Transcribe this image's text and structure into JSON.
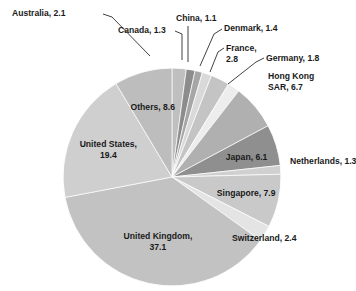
{
  "chart_data": {
    "type": "pie",
    "title": "",
    "subtitle": "",
    "xlabel": "",
    "ylabel": "",
    "legend_position": "none",
    "grid": false,
    "units": "percent",
    "total": 100.0,
    "start_angle_deg": 0,
    "direction": "clockwise",
    "categories": [
      "Australia",
      "Canada",
      "China",
      "Denmark",
      "France",
      "Germany",
      "Hong Kong SAR",
      "Japan",
      "Netherlands",
      "Singapore",
      "Switzerland",
      "United Kingdom",
      "United States",
      "Others"
    ],
    "values": [
      2.1,
      1.3,
      1.1,
      1.4,
      2.8,
      1.8,
      6.7,
      6.1,
      1.3,
      7.9,
      2.4,
      37.1,
      19.4,
      8.6
    ],
    "slices": [
      {
        "name": "Australia",
        "value": 2.1,
        "label": "Australia, 2.1",
        "color": "#bfbfbf",
        "label_style": "callout"
      },
      {
        "name": "Canada",
        "value": 1.3,
        "label": "Canada, 1.3",
        "color": "#8c8c8c",
        "label_style": "callout"
      },
      {
        "name": "China",
        "value": 1.1,
        "label": "China, 1.1",
        "color": "#a6a6a6",
        "label_style": "callout"
      },
      {
        "name": "Denmark",
        "value": 1.4,
        "label": "Denmark, 1.4",
        "color": "#d9d9d9",
        "label_style": "callout"
      },
      {
        "name": "France",
        "value": 2.8,
        "label": "France,\n2.8",
        "color": "#c4c4c4",
        "label_style": "callout"
      },
      {
        "name": "Germany",
        "value": 1.8,
        "label": "Germany, 1.8",
        "color": "#ededed",
        "label_style": "callout"
      },
      {
        "name": "Hong Kong SAR",
        "value": 6.7,
        "label": "Hong Kong\nSAR, 6.7",
        "color": "#b0b0b0",
        "label_style": "callout"
      },
      {
        "name": "Japan",
        "value": 6.1,
        "label": "Japan, 6.1",
        "color": "#8f8f8f",
        "label_style": "inside"
      },
      {
        "name": "Netherlands",
        "value": 1.3,
        "label": "Netherlands, 1.3",
        "color": "#d0d0d0",
        "label_style": "callout"
      },
      {
        "name": "Singapore",
        "value": 7.9,
        "label": "Singapore, 7.9",
        "color": "#c9c9c9",
        "label_style": "inside"
      },
      {
        "name": "Switzerland",
        "value": 2.4,
        "label": "Switzerland, 2.4",
        "color": "#e4e4e4",
        "label_style": "callout"
      },
      {
        "name": "United Kingdom",
        "value": 37.1,
        "label": "United Kingdom,\n37.1",
        "color": "#c2c2c2",
        "label_style": "inside"
      },
      {
        "name": "United States",
        "value": 19.4,
        "label": "United States,\n19.4",
        "color": "#cfcfcf",
        "label_style": "inside"
      },
      {
        "name": "Others",
        "value": 8.6,
        "label": "Others, 8.6",
        "color": "#bdbdbd",
        "label_style": "inside"
      }
    ],
    "labels_text": {
      "australia": "Australia, 2.1",
      "canada": "Canada, 1.3",
      "china": "China, 1.1",
      "denmark": "Denmark, 1.4",
      "france_line1": "France,",
      "france_line2": "2.8",
      "germany": "Germany, 1.8",
      "hongkong_line1": "Hong Kong",
      "hongkong_line2": "SAR, 6.7",
      "japan": "Japan, 6.1",
      "netherlands": "Netherlands, 1.3",
      "singapore": "Singapore, 7.9",
      "switzerland": "Switzerland, 2.4",
      "uk_line1": "United Kingdom,",
      "uk_line2": "37.1",
      "us_line1": "United States,",
      "us_line2": "19.4",
      "others": "Others, 8.6"
    }
  },
  "geometry": {
    "cx": 172,
    "cy": 177,
    "r": 109
  }
}
